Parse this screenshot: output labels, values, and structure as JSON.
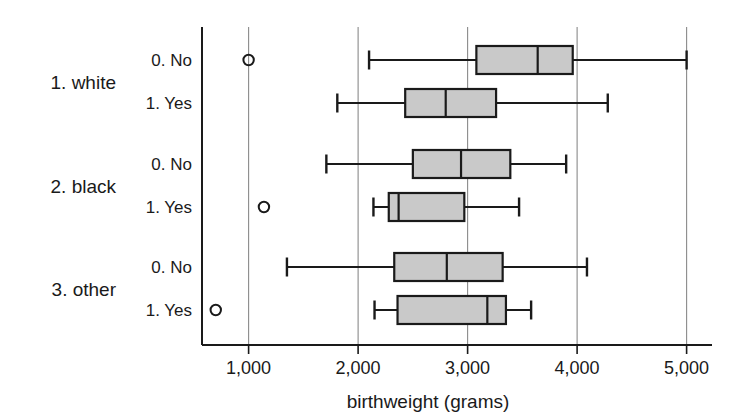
{
  "chart_data": {
    "type": "box",
    "title": "",
    "xlabel": "birthweight (grams)",
    "ylabel": "",
    "xlim": [
      620,
      720
    ],
    "xticks": [
      1000,
      2000,
      3000,
      4000,
      5000
    ],
    "xtick_labels": [
      "1,000",
      "2,000",
      "3,000",
      "4,000",
      "5,000"
    ],
    "grid": "vertical",
    "legend": "none",
    "box_fill": "#c9c9c9",
    "line_color": "#1a1a1a",
    "grid_color": "#8a8a8a",
    "groups": [
      {
        "label": "1. white",
        "rows": [
          {
            "label": "0. No",
            "whisker_low": 2100,
            "q1": 3080,
            "median": 3640,
            "q3": 3960,
            "whisker_high": 5000,
            "outliers": [
              1000
            ]
          },
          {
            "label": "1. Yes",
            "whisker_low": 1810,
            "q1": 2430,
            "median": 2800,
            "q3": 3260,
            "whisker_high": 4280,
            "outliers": []
          }
        ]
      },
      {
        "label": "2. black",
        "rows": [
          {
            "label": "0. No",
            "whisker_low": 1710,
            "q1": 2500,
            "median": 2940,
            "q3": 3390,
            "whisker_high": 3900,
            "outliers": []
          },
          {
            "label": "1. Yes",
            "whisker_low": 2140,
            "q1": 2280,
            "median": 2370,
            "q3": 2970,
            "whisker_high": 3470,
            "outliers": [
              1140
            ]
          }
        ]
      },
      {
        "label": "3. other",
        "rows": [
          {
            "label": "0. No",
            "whisker_low": 1350,
            "q1": 2330,
            "median": 2810,
            "q3": 3320,
            "whisker_high": 4090,
            "outliers": []
          },
          {
            "label": "1. Yes",
            "whisker_low": 2150,
            "q1": 2360,
            "median": 3180,
            "q3": 3350,
            "whisker_high": 3580,
            "outliers": [
              700
            ]
          }
        ]
      }
    ]
  }
}
